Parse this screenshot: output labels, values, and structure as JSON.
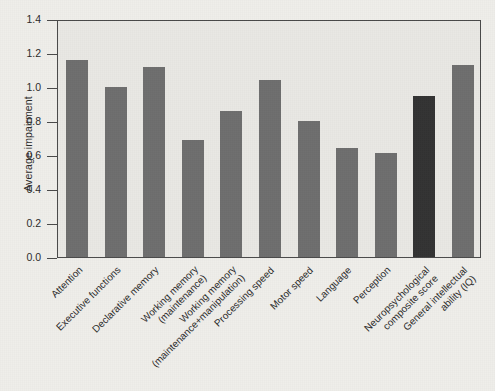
{
  "chart_data": {
    "type": "bar",
    "title": "",
    "xlabel": "",
    "ylabel": "Average impairment",
    "ylim": [
      0.0,
      1.4
    ],
    "ytick_labels": [
      "0.0",
      "0.2",
      "0.4",
      "0.6",
      "0.8",
      "1.0",
      "1.2",
      "1.4"
    ],
    "ytick_values": [
      0.0,
      0.2,
      0.4,
      0.6,
      0.8,
      1.0,
      1.2,
      1.4
    ],
    "grid": false,
    "legend": false,
    "categories": [
      "Attention",
      "Executive functions",
      "Declarative memory",
      "Working memory\n(maintenance)",
      "Working memory\n(maintenance+manipulation)",
      "Processing speed",
      "Motor speed",
      "Language",
      "Perception",
      "Neuropsychological\ncomposite score",
      "General intellectual\nability (IQ)"
    ],
    "category_lines": [
      [
        "Attention"
      ],
      [
        "Executive functions"
      ],
      [
        "Declarative memory"
      ],
      [
        "Working memory",
        "(maintenance)"
      ],
      [
        "Working memory",
        "(maintenance+manipulation)"
      ],
      [
        "Processing speed"
      ],
      [
        "Motor speed"
      ],
      [
        "Language"
      ],
      [
        "Perception"
      ],
      [
        "Neuropsychological",
        "composite score"
      ],
      [
        "General intellectual",
        "ability (IQ)"
      ]
    ],
    "values": [
      1.16,
      1.0,
      1.12,
      0.69,
      0.86,
      1.04,
      0.8,
      0.64,
      0.61,
      0.95,
      1.13
    ],
    "bar_colors": [
      "#6e6e6e",
      "#6e6e6e",
      "#6e6e6e",
      "#6e6e6e",
      "#6e6e6e",
      "#6e6e6e",
      "#6e6e6e",
      "#6e6e6e",
      "#6e6e6e",
      "#333333",
      "#6e6e6e"
    ],
    "highlight_index": 9,
    "colors": {
      "bar": "#6e6e6e",
      "bar_highlight": "#333333",
      "plot_background": "#e9e8e4",
      "page_background": "#efeeea",
      "axis": "#4a4a4a",
      "text": "#2b2b2b"
    }
  }
}
